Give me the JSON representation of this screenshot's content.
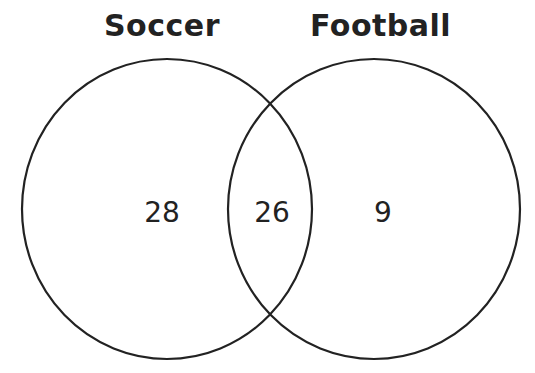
{
  "diagram": {
    "type": "venn",
    "sets": [
      {
        "label": "Soccer",
        "only_count": "28"
      },
      {
        "label": "Football",
        "only_count": "9"
      }
    ],
    "intersection": {
      "label": "Soccer and Football",
      "count": "26"
    },
    "colors": {
      "stroke": "#222222",
      "text": "#222222",
      "background": "#ffffff"
    }
  }
}
